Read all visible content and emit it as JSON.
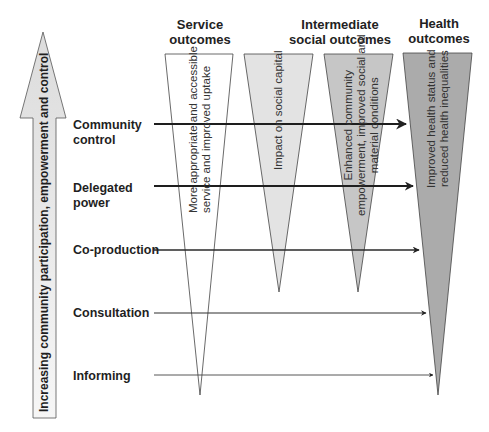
{
  "axis": {
    "label": "Increasing community participation, empowerment and control"
  },
  "headers": {
    "service": "Service outcomes",
    "service_l1": "Service",
    "service_l2": "outcomes",
    "intermediate_l1": "Intermediate",
    "intermediate_l2": "social outcomes",
    "health_l1": "Health",
    "health_l2": "outcomes"
  },
  "levels": [
    {
      "l1": "Community",
      "l2": "control"
    },
    {
      "l1": "Delegated",
      "l2": "power"
    },
    {
      "l1": "Co-production",
      "l2": ""
    },
    {
      "l1": "Consultation",
      "l2": ""
    },
    {
      "l1": "Informing",
      "l2": ""
    }
  ],
  "triangles": {
    "service": {
      "l1": "More appropriate and accessible",
      "l2": "service and improved uptake",
      "fill": "#ffffff"
    },
    "social_capital": {
      "l1": "Impact on social capital",
      "fill": "#e2e2e2"
    },
    "empowerment": {
      "l1": "Enhanced community",
      "l2": "empowerment, improved social and",
      "l3": "material conditions",
      "fill": "#c4c4c4"
    },
    "health": {
      "l1": "Improved health status and",
      "l2": "reduced health inequalities",
      "fill": "#a9a9a9"
    }
  },
  "colors": {
    "arrow_fill": "#e6e6e6",
    "stroke": "#333333"
  }
}
